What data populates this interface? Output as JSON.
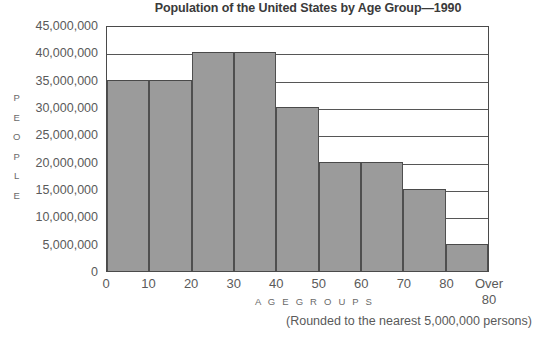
{
  "chart_data": {
    "type": "bar",
    "title": "Population of the United States by Age Group—1990",
    "xlabel": "A G E   G R O U P S",
    "ylabel": "PEOPLE",
    "note": "(Rounded to the nearest 5,000,000 persons)",
    "categories": [
      "0–10",
      "10–20",
      "20–30",
      "30–40",
      "40–50",
      "50–60",
      "60–70",
      "70–80",
      "Over 80"
    ],
    "values": [
      35000000,
      35000000,
      40000000,
      40000000,
      30000000,
      20000000,
      20000000,
      15000000,
      5000000
    ],
    "x_tick_labels": [
      "0",
      "10",
      "20",
      "30",
      "40",
      "50",
      "60",
      "70",
      "80",
      "Over 80"
    ],
    "y_tick_labels": [
      "45,000,000",
      "40,000,000",
      "35,000,000",
      "30,000,000",
      "25,000,000",
      "20,000,000",
      "15,000,000",
      "10,000,000",
      "5,000,000",
      "0"
    ],
    "y_tick_values": [
      45000000,
      40000000,
      35000000,
      30000000,
      25000000,
      20000000,
      15000000,
      10000000,
      5000000,
      0
    ],
    "ylim": [
      0,
      45000000
    ],
    "grid": true,
    "legend": "none",
    "colors": {
      "bar_fill": "#9b9b9b",
      "bar_outline": "#4a4a4a",
      "gridline": "#565656",
      "title_text": "#3a3a3a",
      "label_text": "#5a5a5a",
      "background": "#ffffff"
    }
  },
  "y_axis_title_letters": [
    "P",
    "E",
    "O",
    "P",
    "L",
    "E"
  ]
}
